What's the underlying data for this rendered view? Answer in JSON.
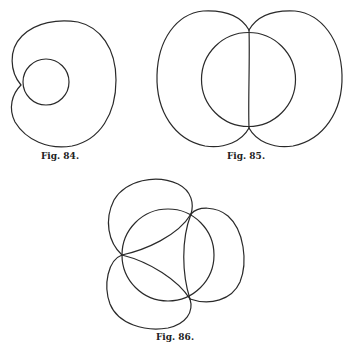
{
  "figures": [
    {
      "id": "fig84",
      "caption": "Fig. 84.",
      "description": "Limaçon with inner circle tangent at cusp"
    },
    {
      "id": "fig85",
      "caption": "Fig. 85.",
      "description": "Two-lobed curve with inscribed circle and vertical chord"
    },
    {
      "id": "fig86",
      "caption": "Fig. 86.",
      "description": "Three-lobed curve with central circle and three cusps"
    }
  ],
  "colors": {
    "stroke": "#2a2a2a",
    "background": "#ffffff"
  }
}
